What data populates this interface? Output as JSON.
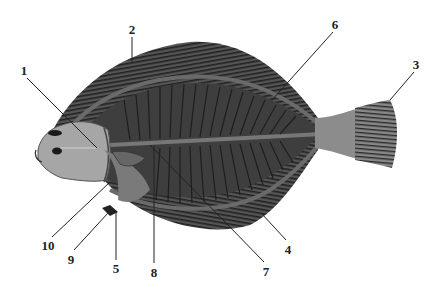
{
  "diagram": {
    "colors": {
      "background": "#ffffff",
      "body": "#4a4a4a",
      "fin_rays": "#2a2a2a",
      "head": "#a6a6a6",
      "caudal_peduncle": "#8c8c8c",
      "leader_line": "#222222"
    },
    "labels": [
      {
        "id": "1",
        "text": "1",
        "x": 24,
        "y": 70
      },
      {
        "id": "2",
        "text": "2",
        "x": 132,
        "y": 29
      },
      {
        "id": "3",
        "text": "3",
        "x": 416,
        "y": 64
      },
      {
        "id": "4",
        "text": "4",
        "x": 288,
        "y": 249
      },
      {
        "id": "5",
        "text": "5",
        "x": 116,
        "y": 268
      },
      {
        "id": "6",
        "text": "6",
        "x": 335,
        "y": 24
      },
      {
        "id": "7",
        "text": "7",
        "x": 266,
        "y": 271
      },
      {
        "id": "8",
        "text": "8",
        "x": 154,
        "y": 272
      },
      {
        "id": "9",
        "text": "9",
        "x": 71,
        "y": 259
      },
      {
        "id": "10",
        "text": "10",
        "x": 48,
        "y": 245
      }
    ]
  }
}
